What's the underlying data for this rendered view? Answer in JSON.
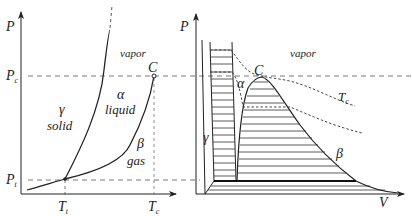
{
  "left_panel": {
    "title": "P-T phase diagram",
    "y_axis_label": "P",
    "x_axis_label": "",
    "tick_labels": {
      "Pc": "P",
      "Pc_sub": "c",
      "Pt": "P",
      "Pt_sub": "t",
      "Tt": "T",
      "Tt_sub": "t",
      "Tc": "T",
      "Tc_sub": "c"
    },
    "critical_point_label": "C",
    "regions": {
      "vapor": "vapor",
      "solid_symbol": "γ",
      "solid": "solid",
      "liquid_symbol": "α",
      "liquid": "liquid",
      "gas_symbol": "β",
      "gas": "gas"
    }
  },
  "right_panel": {
    "title": "P-V projection",
    "y_axis_label": "P",
    "x_axis_label": "V",
    "critical_point_label": "C",
    "isotherm_label": "T",
    "isotherm_sub": "c",
    "regions": {
      "vapor": "vapor",
      "liquid_symbol": "α",
      "solid_symbol": "γ",
      "gas_symbol": "β"
    }
  },
  "colors": {
    "line": "#222222",
    "dashed": "#555555",
    "background": "#ffffff"
  }
}
